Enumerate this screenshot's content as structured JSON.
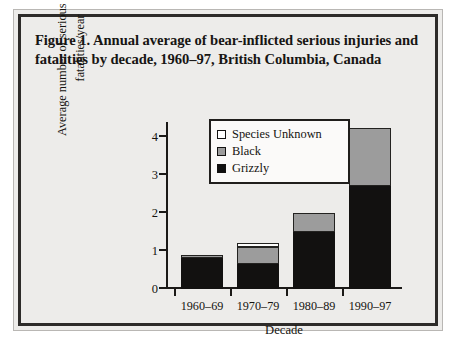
{
  "figure": {
    "title": "Figure 1. Annual average of bear-inflicted serious injuries and fatalities by decade, 1960–97, British Columbia, Canada",
    "border_color": "#2d2b29",
    "background_color": "#edecea"
  },
  "chart_data": {
    "type": "bar",
    "stacked": true,
    "title": "Figure 1. Annual average of bear-inflicted serious injuries and fatalities by decade, 1960–97, British Columbia, Canada",
    "xlabel": "Decade",
    "ylabel": "Average number of serious injuries and fatalities/year",
    "ylabel_line1": "Average number of serious injuries and",
    "ylabel_line2": "fatalities/year",
    "categories": [
      "1960–69",
      "1970–79",
      "1980–89",
      "1990–97"
    ],
    "series": [
      {
        "name": "Grizzly",
        "color": "#121110",
        "values": [
          0.82,
          0.66,
          1.5,
          2.7
        ]
      },
      {
        "name": "Black",
        "color": "#9c9c9c",
        "values": [
          0.08,
          0.44,
          0.5,
          1.55
        ]
      },
      {
        "name": "Species Unknown",
        "color": "#ffffff",
        "values": [
          0,
          0.1,
          0,
          0
        ]
      }
    ],
    "totals": [
      0.9,
      1.2,
      2.0,
      4.25
    ],
    "yticks": [
      0,
      1,
      2,
      3,
      4
    ],
    "ytick_labels": [
      "0",
      "1",
      "2",
      "3",
      "4"
    ],
    "ylim": [
      0,
      4.4
    ],
    "grid": false,
    "legend_position": "upper center",
    "legend_entries": [
      "Species Unknown",
      "Black",
      "Grizzly"
    ]
  },
  "legend": {
    "items": [
      {
        "label": "Species Unknown",
        "swatch": "white-square-icon"
      },
      {
        "label": "Black",
        "swatch": "gray-square-icon"
      },
      {
        "label": "Grizzly",
        "swatch": "black-square-icon"
      }
    ]
  }
}
